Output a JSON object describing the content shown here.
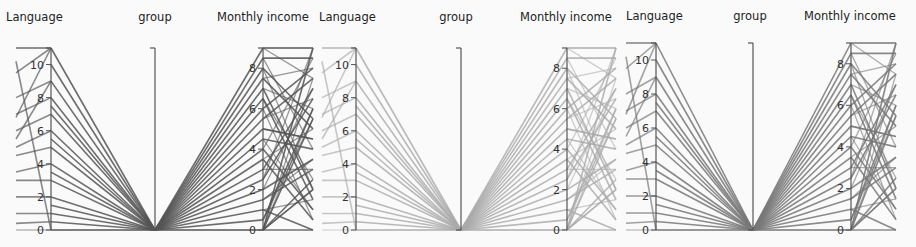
{
  "chart_data": [
    {
      "type": "parallel_coordinates",
      "panel": "left",
      "axes": [
        "Language",
        "group",
        "Monthly income"
      ],
      "axis_ranges": {
        "Language": [
          0,
          11
        ],
        "group": [
          0,
          1
        ],
        "Monthly income": [
          0,
          9
        ]
      },
      "ticks": {
        "Language": [
          0,
          2,
          4,
          6,
          8,
          10
        ],
        "group": [],
        "Monthly income": [
          0,
          2,
          4,
          6,
          8
        ]
      },
      "line_color": "#555555",
      "line_opacity": 0.85,
      "language_values": [
        11,
        9,
        8,
        7,
        6,
        5,
        4,
        3,
        2,
        1,
        0.5,
        0
      ],
      "group_value": 0,
      "monthly_income_values": [
        9,
        8,
        7,
        6,
        5,
        4,
        3,
        2,
        1,
        0.5,
        0
      ],
      "right_values": [
        9,
        8.5,
        8,
        7.5,
        7,
        6.5,
        6,
        5.5,
        5,
        4.5,
        4,
        3.5,
        3,
        2.5,
        2,
        1.5,
        1,
        0.5,
        0
      ]
    },
    {
      "type": "parallel_coordinates",
      "panel": "middle",
      "axes": [
        "Language",
        "group",
        "Monthly income"
      ],
      "axis_ranges": {
        "Language": [
          0,
          11
        ],
        "group": [
          0,
          1
        ],
        "Monthly income": [
          0,
          9
        ]
      },
      "ticks": {
        "Language": [
          0,
          2,
          4,
          6,
          8,
          10
        ],
        "group": [],
        "Monthly income": [
          0,
          2,
          4,
          6,
          8
        ]
      },
      "line_color": "#aaaaaa",
      "line_opacity": 0.8,
      "language_values": [
        11,
        9,
        8,
        7,
        6,
        5,
        4,
        3,
        2,
        1,
        0.5,
        0
      ],
      "group_value": 0,
      "monthly_income_values": [
        9,
        8,
        7,
        6,
        5,
        4,
        3,
        2,
        1,
        0.5,
        0
      ],
      "right_values": [
        9,
        8.5,
        8,
        7.5,
        7,
        6.5,
        6,
        5.5,
        5,
        4.5,
        4,
        3.5,
        3,
        2.5,
        2,
        1.5,
        1,
        0.5,
        0
      ]
    },
    {
      "type": "parallel_coordinates",
      "panel": "right",
      "axes": [
        "Language",
        "group",
        "Monthly income"
      ],
      "axis_ranges": {
        "Language": [
          0,
          11
        ],
        "group": [
          0,
          1
        ],
        "Monthly income": [
          0,
          9
        ]
      },
      "ticks": {
        "Language": [
          0,
          2,
          4,
          6,
          8,
          10
        ],
        "group": [],
        "Monthly income": [
          0,
          2,
          4,
          6,
          8
        ]
      },
      "line_color": "#777777",
      "line_opacity": 0.85,
      "language_values": [
        11,
        9,
        8,
        7,
        6,
        5,
        4,
        3,
        2,
        1,
        0.5,
        0
      ],
      "group_value": 0,
      "monthly_income_values": [
        9,
        8,
        7,
        6,
        5,
        4,
        3,
        2,
        1,
        0.5,
        0
      ],
      "right_values": [
        9,
        8.5,
        8,
        7.5,
        7,
        6.5,
        6,
        5.5,
        5,
        4.5,
        4,
        3.5,
        3,
        2.5,
        2,
        1.5,
        1,
        0.5,
        0
      ]
    }
  ],
  "panels": [
    {
      "axis_titles": {
        "language": "Language",
        "group": "group",
        "income": "Monthly income"
      }
    },
    {
      "axis_titles": {
        "language": "Language",
        "group": "group",
        "income": "Monthly income"
      }
    },
    {
      "axis_titles": {
        "language": "Language",
        "group": "group",
        "income": "Monthly income"
      }
    }
  ],
  "tick_labels": {
    "language": [
      "0",
      "2",
      "4",
      "6",
      "8",
      "10"
    ],
    "income": [
      "0",
      "2",
      "4",
      "6",
      "8"
    ]
  }
}
